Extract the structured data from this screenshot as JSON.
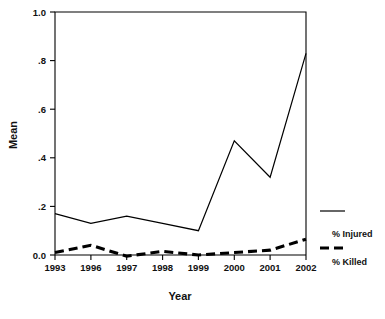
{
  "chart_data": {
    "type": "line",
    "title": "",
    "xlabel": "Year",
    "ylabel": "Mean",
    "categories": [
      "1993",
      "1996",
      "1997",
      "1998",
      "1999",
      "2000",
      "2001",
      "2002"
    ],
    "x_tick_labels": [
      "1993",
      "1996",
      "1997",
      "1998",
      "1999",
      "2000",
      "2001",
      "2002"
    ],
    "y_tick_labels": [
      "0.0",
      ".2",
      ".4",
      ".6",
      ".8",
      "1.0"
    ],
    "y_tick_values": [
      0.0,
      0.2,
      0.4,
      0.6,
      0.8,
      1.0
    ],
    "ylim": [
      0.0,
      1.0
    ],
    "grid": false,
    "legend_position": "right-outside",
    "series": [
      {
        "name": "% Injured",
        "style": "solid",
        "color": "#000000",
        "values": [
          0.17,
          0.13,
          0.16,
          0.13,
          0.1,
          0.47,
          0.32,
          0.83
        ]
      },
      {
        "name": "% Killed",
        "style": "dashed",
        "color": "#000000",
        "values": [
          0.01,
          0.04,
          -0.005,
          0.015,
          0.0,
          0.01,
          0.02,
          0.065
        ]
      }
    ]
  },
  "legend": {
    "entries": [
      {
        "label": "% Injured",
        "style": "solid"
      },
      {
        "label": "% Killed",
        "style": "dashed"
      }
    ]
  },
  "axes": {
    "y_title": "Mean",
    "x_title": "Year"
  }
}
